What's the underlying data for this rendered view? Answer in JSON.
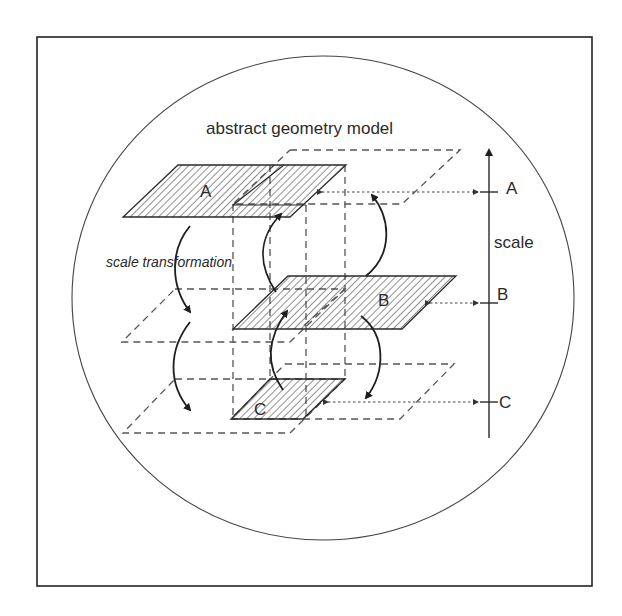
{
  "diagram": {
    "title": "abstract geometry model",
    "transformation_label": "scale transformation",
    "axis_label": "scale",
    "planes": [
      {
        "id": "A",
        "label": "A"
      },
      {
        "id": "B",
        "label": "B"
      },
      {
        "id": "C",
        "label": "C"
      }
    ],
    "axis_ticks": [
      {
        "id": "A",
        "label": "A"
      },
      {
        "id": "B",
        "label": "B"
      },
      {
        "id": "C",
        "label": "C"
      }
    ],
    "colors": {
      "line": "#2a2a2a",
      "dashed": "#555555",
      "background": "#ffffff"
    }
  }
}
